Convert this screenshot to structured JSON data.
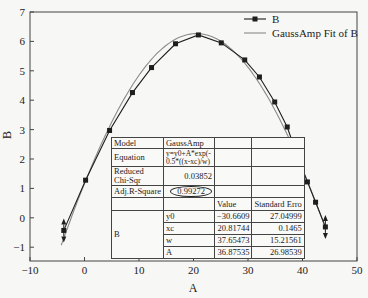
{
  "chart_data": {
    "type": "line",
    "title": "",
    "xlabel": "A",
    "ylabel": "B",
    "xlim": [
      -10,
      50
    ],
    "ylim": [
      -1.5,
      7
    ],
    "xticks": [
      -10,
      0,
      10,
      20,
      30,
      40,
      50
    ],
    "yticks": [
      -1,
      0,
      1,
      2,
      3,
      4,
      5,
      6,
      7
    ],
    "grid": false,
    "legend_position": "top-right",
    "series": [
      {
        "name": "B",
        "style": "line+square-markers",
        "color": "#1e1e1e",
        "x": [
          -3.8,
          0.2,
          4.6,
          8.8,
          12.3,
          16.7,
          20.9,
          25.1,
          29.4,
          32.1,
          34.9,
          37.2,
          39.0,
          40.9,
          42.4,
          44.2
        ],
        "y": [
          -0.43,
          1.28,
          2.97,
          4.26,
          5.11,
          5.92,
          6.22,
          5.95,
          5.37,
          4.79,
          3.94,
          3.09,
          2.13,
          1.22,
          0.53,
          -0.31
        ],
        "endpoint_arrows": true
      },
      {
        "name": "GaussAmp Fit of B",
        "style": "line",
        "color": "#8a8a8a",
        "model": "GaussAmp",
        "params": {
          "y0": -30.6609,
          "xc": 20.81744,
          "w": 37.65473,
          "A": 36.87535
        }
      }
    ],
    "fit_table": {
      "model_label": "Model",
      "model_value": "GaussAmp",
      "equation_label": "Equation",
      "equation_value": "y=y0+A*exp(-0.5*((x-xc)/w)^2)",
      "equation_line1": "y=y0+A*exp(-",
      "equation_line2": "0.5*((x-xc)/w)",
      "chi_label_1": "Reduced",
      "chi_label_2": "Chi-Sqr",
      "chi_value": "0.03852",
      "adj_r_label": "Adj.R-Square",
      "adj_r_value": "0.99272",
      "header_value": "Value",
      "header_error": "Standard Erro",
      "group_label": "B",
      "params": [
        {
          "name": "y0",
          "value": "−30.6609",
          "error": "27.04999"
        },
        {
          "name": "xc",
          "value": "20.81744",
          "error": "0.1465"
        },
        {
          "name": "w",
          "value": "37.65473",
          "error": "15.21561"
        },
        {
          "name": "A",
          "value": "36.87535",
          "error": "26.98539"
        }
      ]
    }
  }
}
